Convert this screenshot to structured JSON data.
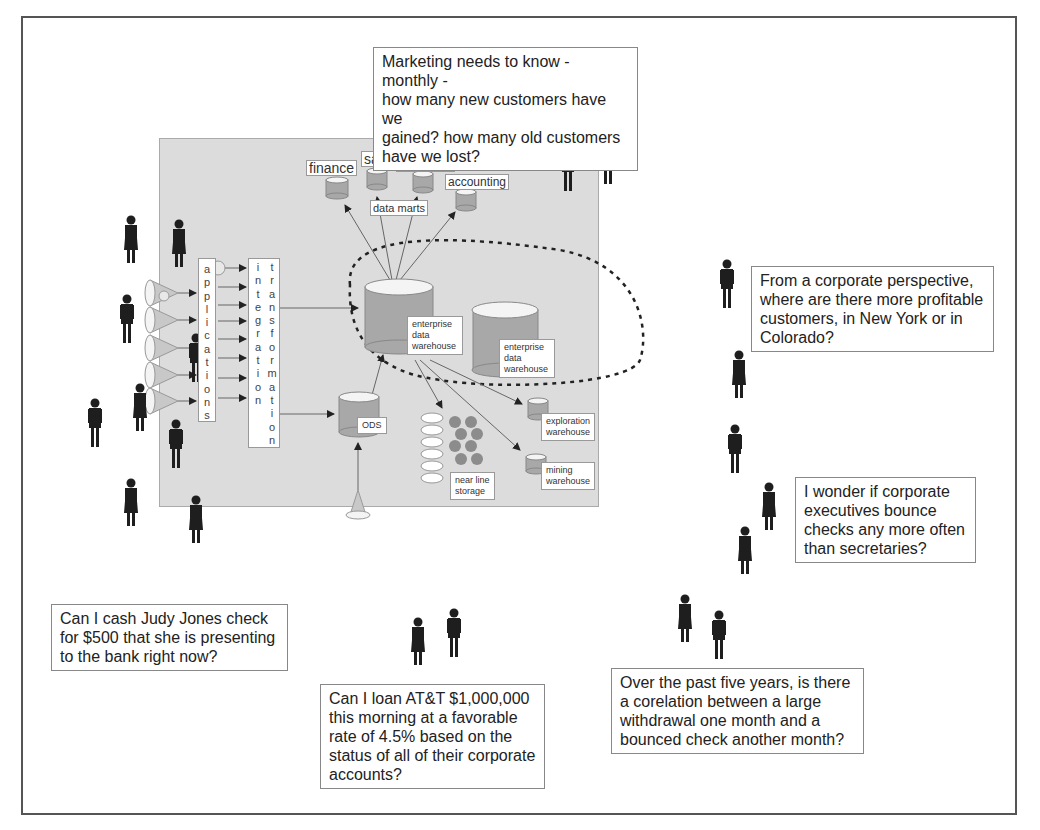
{
  "diagram": {
    "type": "enterprise data warehouse architecture with user questions",
    "colors": {
      "panel": "#dcdcdc",
      "cylinder": "#a8a8a8",
      "cylinder_top": "#f4f4f4",
      "person": "#1e1e1e",
      "frame": "#555555"
    },
    "components": {
      "applications_label": "applications",
      "integration_label": "integration",
      "transformation_label": "transformation",
      "edw_primary_label": [
        "enterprise",
        "data",
        "warehouse"
      ],
      "edw_secondary_label": [
        "enterprise",
        "data",
        "warehouse"
      ],
      "ods_label": "ODS",
      "near_line_label": [
        "near line",
        "storage"
      ],
      "exploration_label": [
        "exploration",
        "warehouse"
      ],
      "mining_label": [
        "mining",
        "warehouse"
      ],
      "data_marts_label": "data marts",
      "marts": [
        "finance",
        "sales",
        "marketing",
        "accounting"
      ]
    },
    "questions": [
      {
        "id": "marketing",
        "lines": [
          "Marketing needs to know - monthly -",
          "how many new customers have we",
          "gained? how many old customers",
          "have we lost?"
        ]
      },
      {
        "id": "corporate",
        "lines": [
          "From a corporate perspective,",
          "where are there more profitable",
          "customers, in New York or in",
          "Colorado?"
        ]
      },
      {
        "id": "executives",
        "lines": [
          "I wonder if corporate",
          "executives bounce",
          "checks any more often",
          "than secretaries?"
        ]
      },
      {
        "id": "correlation",
        "lines": [
          "Over the past five years, is there",
          "a corelation between a large",
          "withdrawal one month and a",
          "bounced check another month?"
        ]
      },
      {
        "id": "loan",
        "lines": [
          "Can I loan AT&T $1,000,000",
          "this morning at a favorable",
          "rate of 4.5% based on the",
          "status of all of their corporate",
          "accounts?"
        ]
      },
      {
        "id": "cash",
        "lines": [
          "Can I cash Judy Jones check",
          "for $500 that she is presenting",
          "to the bank right now?"
        ]
      }
    ]
  }
}
